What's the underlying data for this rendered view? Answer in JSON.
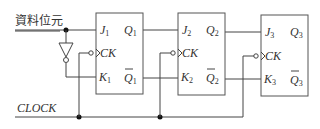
{
  "input_label": "資料位元",
  "clock_label": "CLOCK",
  "flip_flops": [
    {
      "j": "J",
      "k": "K",
      "ck": "CK",
      "q": "Q",
      "qbar": "Q",
      "index": "1"
    },
    {
      "j": "J",
      "k": "K",
      "ck": "CK",
      "q": "Q",
      "qbar": "Q",
      "index": "2"
    },
    {
      "j": "J",
      "k": "K",
      "ck": "CK",
      "q": "Q",
      "qbar": "Q",
      "index": "3"
    }
  ],
  "colors": {
    "line": "#444444",
    "text": "#333333",
    "background": "#ffffff"
  }
}
